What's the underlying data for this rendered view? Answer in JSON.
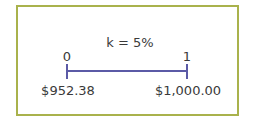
{
  "diagram": {
    "type": "timeline",
    "rate_label": "k = 5%",
    "periods": [
      {
        "label": "0",
        "value_label": "$952.38"
      },
      {
        "label": "1",
        "value_label": "$1,000.00"
      }
    ],
    "colors": {
      "frame": "#a9b24c",
      "timeline": "#5b5aa6",
      "text": "#3a3a3a"
    }
  }
}
